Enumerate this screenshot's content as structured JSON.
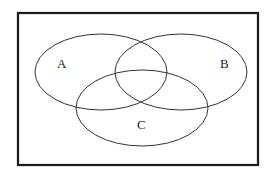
{
  "diagram": {
    "type": "venn",
    "sets": [
      {
        "label": "A"
      },
      {
        "label": "B"
      },
      {
        "label": "C"
      }
    ],
    "colors": {
      "stroke": "#333333",
      "frame": "#1a1a1a",
      "background": "#ffffff"
    }
  }
}
